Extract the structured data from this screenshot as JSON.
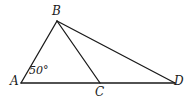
{
  "figure": {
    "type": "geometry-diagram",
    "stroke_color": "#1a1a1a",
    "background_color": "#ffffff",
    "labels": {
      "A": "A",
      "B": "B",
      "C": "C",
      "D": "D",
      "angle_A": "50°"
    },
    "points": {
      "A": {
        "x": 21,
        "y": 83
      },
      "B": {
        "x": 57,
        "y": 21
      },
      "C": {
        "x": 100,
        "y": 83
      },
      "D": {
        "x": 175,
        "y": 83
      }
    },
    "segments": [
      {
        "name": "AD",
        "from": "A",
        "to": "D"
      },
      {
        "name": "AB",
        "from": "A",
        "to": "B"
      },
      {
        "name": "BC",
        "from": "B",
        "to": "C"
      },
      {
        "name": "BD",
        "from": "B",
        "to": "D"
      }
    ],
    "angles": [
      {
        "at": "A",
        "value": "50°"
      }
    ]
  }
}
